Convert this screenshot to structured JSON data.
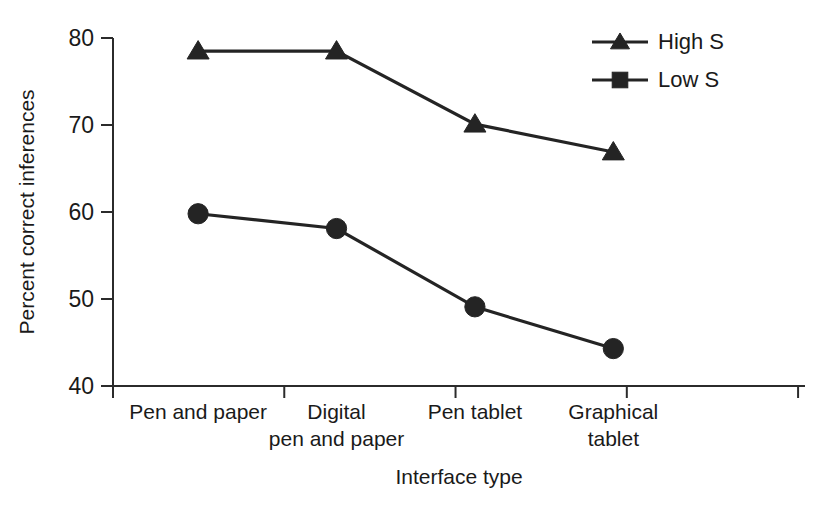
{
  "chart_data": {
    "type": "line",
    "title": "",
    "xlabel": "Interface type",
    "ylabel": "Percent correct inferences",
    "categories": [
      "Pen and paper",
      "Digital\npen and paper",
      "Pen tablet",
      "Graphical\ntablet"
    ],
    "category_lines": [
      [
        "Pen and paper"
      ],
      [
        "Digital",
        "pen and paper"
      ],
      [
        "Pen tablet"
      ],
      [
        "Graphical",
        "tablet"
      ]
    ],
    "ylim": [
      40,
      80
    ],
    "yticks": [
      40,
      50,
      60,
      70,
      80
    ],
    "ytick_labels": [
      "40",
      "50",
      "60",
      "70",
      "80"
    ],
    "grid": false,
    "legend_position": "top-right",
    "series": [
      {
        "name": "High S",
        "marker": "triangle",
        "color": "#242424",
        "values": [
          78.5,
          78.5,
          70.1,
          66.9
        ]
      },
      {
        "name": "Low S",
        "marker": "square",
        "plot_marker": "circle",
        "color": "#242424",
        "values": [
          59.8,
          58.1,
          49.1,
          44.3
        ]
      }
    ]
  },
  "legend": {
    "items": [
      {
        "label": "High S",
        "marker": "triangle"
      },
      {
        "label": "Low S",
        "marker": "square"
      }
    ]
  }
}
